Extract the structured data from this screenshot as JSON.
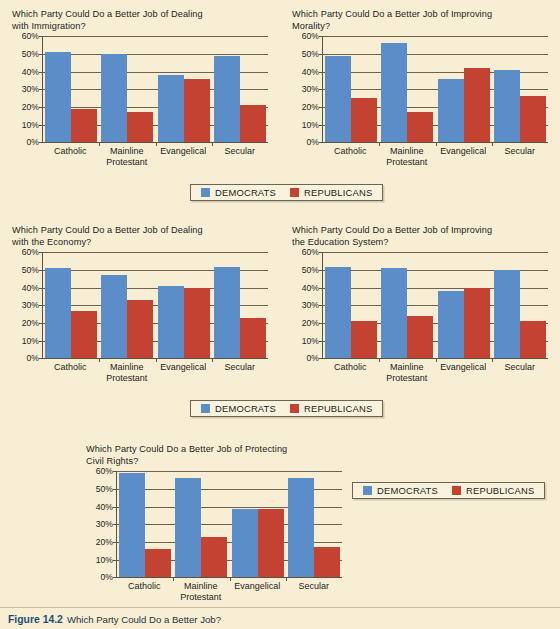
{
  "figure": {
    "number": "Figure 14.2",
    "caption": "Which Party Could Do a Better Job?"
  },
  "legend": {
    "democrats": "DEMOCRATS",
    "republicans": "REPUBLICANS",
    "democrats_color": "#5b8ec9",
    "republicans_color": "#c34231"
  },
  "axis": {
    "ticks": [
      "60%",
      "50%",
      "40%",
      "30%",
      "20%",
      "10%",
      "0%"
    ],
    "categories": [
      "Catholic",
      "Mainline\nProtestant",
      "Evangelical",
      "Secular"
    ]
  },
  "chart_data": [
    {
      "type": "bar",
      "title": "Which Party Could Do a Better Job of Dealing\nwith Immigration?",
      "categories": [
        "Catholic",
        "Mainline Protestant",
        "Evangelical",
        "Secular"
      ],
      "series": [
        {
          "name": "DEMOCRATS",
          "values": [
            51,
            50,
            38,
            49
          ]
        },
        {
          "name": "REPUBLICANS",
          "values": [
            19,
            17,
            36,
            21
          ]
        }
      ],
      "xlabel": "",
      "ylabel": "",
      "ylim": [
        0,
        60
      ],
      "yticks": [
        0,
        10,
        20,
        30,
        40,
        50,
        60
      ],
      "grid": true,
      "legend_position": "bottom"
    },
    {
      "type": "bar",
      "title": "Which Party Could Do a Better Job of  Improving\nMorality?",
      "categories": [
        "Catholic",
        "Mainline Protestant",
        "Evangelical",
        "Secular"
      ],
      "series": [
        {
          "name": "DEMOCRATS",
          "values": [
            49,
            56,
            36,
            41
          ]
        },
        {
          "name": "REPUBLICANS",
          "values": [
            25,
            17,
            42,
            26
          ]
        }
      ],
      "xlabel": "",
      "ylabel": "",
      "ylim": [
        0,
        60
      ],
      "yticks": [
        0,
        10,
        20,
        30,
        40,
        50,
        60
      ],
      "grid": true,
      "legend_position": "bottom"
    },
    {
      "type": "bar",
      "title": "Which Party Could Do a Better Job of Dealing\nwith the Economy?",
      "categories": [
        "Catholic",
        "Mainline Protestant",
        "Evangelical",
        "Secular"
      ],
      "series": [
        {
          "name": "DEMOCRATS",
          "values": [
            51,
            47,
            41,
            52
          ]
        },
        {
          "name": "REPUBLICANS",
          "values": [
            27,
            33,
            40,
            23
          ]
        }
      ],
      "xlabel": "",
      "ylabel": "",
      "ylim": [
        0,
        60
      ],
      "yticks": [
        0,
        10,
        20,
        30,
        40,
        50,
        60
      ],
      "grid": true,
      "legend_position": "bottom"
    },
    {
      "type": "bar",
      "title": "Which Party Could Do a  Better Job of  Improving\nthe  Education System?",
      "categories": [
        "Catholic",
        "Mainline Protestant",
        "Evangelical",
        "Secular"
      ],
      "series": [
        {
          "name": "DEMOCRATS",
          "values": [
            52,
            51,
            38,
            50
          ]
        },
        {
          "name": "REPUBLICANS",
          "values": [
            21,
            24,
            40,
            21
          ]
        }
      ],
      "xlabel": "",
      "ylabel": "",
      "ylim": [
        0,
        60
      ],
      "yticks": [
        0,
        10,
        20,
        30,
        40,
        50,
        60
      ],
      "grid": true,
      "legend_position": "bottom"
    },
    {
      "type": "bar",
      "title": "Which Party Could Do a Better Job of Protecting\nCivil Rights?",
      "categories": [
        "Catholic",
        "Mainline Protestant",
        "Evangelical",
        "Secular"
      ],
      "series": [
        {
          "name": "DEMOCRATS",
          "values": [
            59,
            56,
            39,
            56
          ]
        },
        {
          "name": "REPUBLICANS",
          "values": [
            16,
            23,
            39,
            17
          ]
        }
      ],
      "xlabel": "",
      "ylabel": "",
      "ylim": [
        0,
        60
      ],
      "yticks": [
        0,
        10,
        20,
        30,
        40,
        50,
        60
      ],
      "grid": true,
      "legend_position": "right"
    }
  ]
}
